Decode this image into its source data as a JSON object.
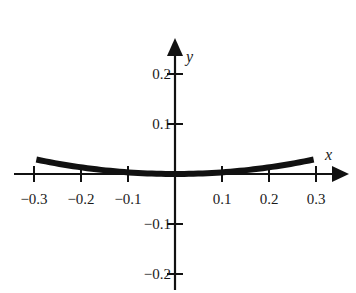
{
  "chart_data": {
    "type": "line",
    "title": "",
    "xlabel": "x",
    "ylabel": "y",
    "xlim": [
      -0.3,
      0.3
    ],
    "ylim": [
      -0.2,
      0.2
    ],
    "grid": false,
    "legend": null,
    "x_ticks": [
      -0.3,
      -0.2,
      -0.1,
      0.1,
      0.2,
      0.3
    ],
    "x_tick_labels": [
      "−0.3",
      "−0.2",
      "−0.1",
      "0.1",
      "0.2",
      "0.3"
    ],
    "y_ticks": [
      0.2,
      0.1,
      -0.1,
      -0.2
    ],
    "y_tick_labels": [
      "0.2",
      "0.1",
      "−0.1",
      "−0.2"
    ],
    "series": [
      {
        "name": "curve",
        "description": "upward-opening parabola approx y = x^2/3",
        "x": [
          -0.3,
          -0.25,
          -0.2,
          -0.15,
          -0.1,
          -0.05,
          0,
          0.05,
          0.1,
          0.15,
          0.2,
          0.25,
          0.3
        ],
        "y": [
          0.03,
          0.0208,
          0.0133,
          0.0075,
          0.0033,
          0.0008,
          0,
          0.0008,
          0.0033,
          0.0075,
          0.0133,
          0.0208,
          0.03
        ]
      }
    ]
  },
  "axes": {
    "x_name": "x",
    "y_name": "y"
  },
  "style": {
    "axis_color": "#111111",
    "curve_color": "#111111"
  }
}
